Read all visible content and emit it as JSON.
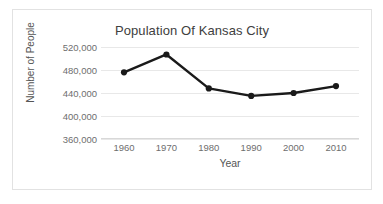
{
  "chart_data": {
    "type": "line",
    "title": "Population Of Kansas City",
    "xlabel": "Year",
    "ylabel": "Number of People",
    "x": [
      1960,
      1970,
      1980,
      1990,
      2000,
      2010
    ],
    "xtick_labels": [
      "1960",
      "1970",
      "1980",
      "1990",
      "2000",
      "2010"
    ],
    "values": [
      476000,
      507000,
      448000,
      435000,
      440000,
      452000
    ],
    "series": [
      {
        "name": "Population",
        "values": [
          476000,
          507000,
          448000,
          435000,
          440000,
          452000
        ]
      }
    ],
    "ytick_values": [
      360000,
      400000,
      440000,
      480000,
      520000
    ],
    "ytick_labels": [
      "360,000",
      "400,000",
      "440,000",
      "480,000",
      "520,000"
    ],
    "ylim": [
      360000,
      520000
    ],
    "xlim": [
      1960,
      2010
    ],
    "grid": "horizontal",
    "legend": "none",
    "line_color": "#1a1a1a",
    "marker": "circle",
    "marker_color": "#1a1a1a",
    "gridline_color": "#e8e8e8",
    "text_color": "#6e6e6e",
    "background_color": "#ffffff",
    "border_color": "#e2e2e2"
  }
}
